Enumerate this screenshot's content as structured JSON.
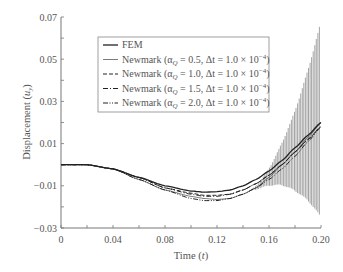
{
  "chart_data": {
    "type": "line",
    "title": "",
    "xlabel": "Time (t)",
    "ylabel": "Displacement (u_y)",
    "xlim": [
      0,
      0.2
    ],
    "ylim": [
      -0.03,
      0.07
    ],
    "x_ticks": [
      "0",
      "0.04",
      "0.08",
      "0.12",
      "0.16",
      "0.20"
    ],
    "y_ticks": [
      "−0.03",
      "−0.01",
      "0.01",
      "0.03",
      "0.05",
      "0.07"
    ],
    "grid": false,
    "legend_position": "upper-center-right (boxed)",
    "x": [
      0,
      0.02,
      0.04,
      0.06,
      0.08,
      0.1,
      0.11,
      0.12,
      0.13,
      0.14,
      0.15,
      0.16,
      0.17,
      0.18,
      0.19,
      0.2
    ],
    "series": [
      {
        "name": "FEM",
        "style": "solid",
        "values": [
          0.0,
          0.0,
          -0.002,
          -0.006,
          -0.01,
          -0.0125,
          -0.013,
          -0.0128,
          -0.012,
          -0.01,
          -0.007,
          -0.003,
          0.002,
          0.008,
          0.014,
          0.02
        ]
      },
      {
        "name": "Newmark (αQ = 0.5, Δt = 1.0 × 10⁻⁴)",
        "style": "thin-solid",
        "values": [
          0.0,
          0.0,
          -0.002,
          -0.007,
          -0.012,
          -0.015,
          -0.016,
          -0.0165,
          -0.016,
          -0.014,
          -0.011,
          -0.006,
          0.0,
          0.006,
          0.013,
          0.02
        ],
        "oscillation_envelope": {
          "max_at_0.20": 0.068,
          "min_at_0.20": -0.025,
          "onset_t": 0.14
        }
      },
      {
        "name": "Newmark (αQ = 1.0, Δt = 1.0 × 10⁻⁴)",
        "style": "dashed",
        "values": [
          0.0,
          0.0,
          -0.002,
          -0.006,
          -0.011,
          -0.0135,
          -0.0145,
          -0.0145,
          -0.014,
          -0.012,
          -0.009,
          -0.005,
          0.0,
          0.006,
          0.012,
          0.018
        ]
      },
      {
        "name": "Newmark (αQ = 1.5, Δt = 1.0 × 10⁻⁴)",
        "style": "dash-dot",
        "values": [
          0.0,
          0.0,
          -0.002,
          -0.006,
          -0.011,
          -0.014,
          -0.015,
          -0.015,
          -0.014,
          -0.012,
          -0.009,
          -0.005,
          0.0,
          0.006,
          0.012,
          0.018
        ]
      },
      {
        "name": "Newmark (αQ = 2.0, Δt = 1.0 × 10⁻⁴)",
        "style": "dash-dot-dot",
        "values": [
          0.0,
          0.0,
          -0.002,
          -0.007,
          -0.012,
          -0.016,
          -0.017,
          -0.017,
          -0.016,
          -0.014,
          -0.011,
          -0.007,
          -0.002,
          0.004,
          0.011,
          0.018
        ]
      }
    ]
  },
  "legend": {
    "items": [
      {
        "label": "FEM",
        "alpha": "",
        "dt": ""
      },
      {
        "label": "Newmark (α",
        "sub": "Q",
        "alpha": " = 0.5, Δt = 1.0 × 10",
        "exp": "−4",
        "close": ")"
      },
      {
        "label": "Newmark (α",
        "sub": "Q",
        "alpha": " = 1.0, Δt = 1.0 × 10",
        "exp": "−4",
        "close": ")"
      },
      {
        "label": "Newmark (α",
        "sub": "Q",
        "alpha": " = 1.5, Δt = 1.0 × 10",
        "exp": "−4",
        "close": ")"
      },
      {
        "label": "Newmark (α",
        "sub": "Q",
        "alpha": " = 2.0, Δt = 1.0 × 10",
        "exp": "−4",
        "close": ")"
      }
    ]
  },
  "axes": {
    "xlabel_main": "Time (",
    "xlabel_var": "t",
    "xlabel_close": ")",
    "ylabel_main": "Displacement (",
    "ylabel_var": "u",
    "ylabel_sub": "y",
    "ylabel_close": ")"
  },
  "style": {
    "axis_color": "#777777",
    "curve_color": "#222222",
    "oscillation_color": "#333333",
    "legend_border": "#888888"
  }
}
